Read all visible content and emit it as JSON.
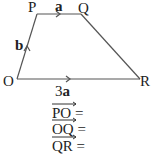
{
  "diagram": {
    "vertices": {
      "P": {
        "label": "P",
        "x": 37,
        "y": 14
      },
      "Q": {
        "label": "Q",
        "x": 81,
        "y": 14
      },
      "O": {
        "label": "O",
        "x": 17,
        "y": 79
      },
      "R": {
        "label": "R",
        "x": 140,
        "y": 79
      }
    },
    "edge_labels": {
      "PQ": "a",
      "OP": "b",
      "OR": "3a"
    },
    "line_color": "#555555"
  },
  "questions": [
    {
      "vector": "PO",
      "suffix": "="
    },
    {
      "vector": "OQ",
      "suffix": "="
    },
    {
      "vector": "QR",
      "suffix": "="
    }
  ]
}
